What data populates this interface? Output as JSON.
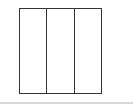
{
  "diagram": {
    "shape": "square",
    "columns": 3,
    "stroke_color": "#333333",
    "fill_color": "#ffffff"
  },
  "footer_line": {
    "color": "#d8d8d8"
  }
}
